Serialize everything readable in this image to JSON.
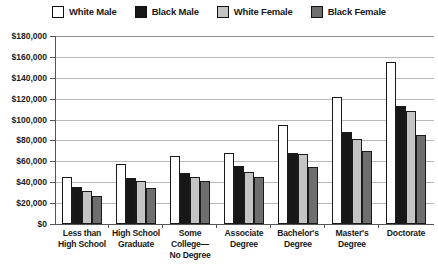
{
  "chart_data": {
    "type": "bar",
    "title": "",
    "xlabel": "",
    "ylabel": "",
    "ylim": [
      0,
      180000
    ],
    "grid": true,
    "legend_position": "top-center",
    "categories": [
      "Less than\nHigh School",
      "High School\nGraduate",
      "Some College—\nNo Degree",
      "Associate\nDegree",
      "Bachelor's\nDegree",
      "Master's\nDegree",
      "Doctorate"
    ],
    "category_lines": [
      [
        "Less than",
        "High School"
      ],
      [
        "High School",
        "Graduate"
      ],
      [
        "Some College—",
        "No Degree"
      ],
      [
        "Associate",
        "Degree"
      ],
      [
        "Bachelor's",
        "Degree"
      ],
      [
        "Master's",
        "Degree"
      ],
      [
        "Doctorate",
        ""
      ]
    ],
    "ytick_labels": [
      "$180,000",
      "$160,000",
      "$140,000",
      "$120,000",
      "$100,000",
      "$80,000",
      "$60,000",
      "$40,000",
      "$20,000",
      "$0"
    ],
    "ytick_values": [
      180000,
      160000,
      140000,
      120000,
      100000,
      80000,
      60000,
      40000,
      20000,
      0
    ],
    "series": [
      {
        "name": "White Male",
        "color": "#ffffff",
        "values": [
          45000,
          57000,
          65000,
          68000,
          95000,
          122000,
          155000
        ]
      },
      {
        "name": "Black Male",
        "color": "#171717",
        "values": [
          35000,
          44000,
          49000,
          56000,
          68000,
          88000,
          113000
        ]
      },
      {
        "name": "White Female",
        "color": "#c4c4c4",
        "values": [
          32000,
          41000,
          45000,
          50000,
          67000,
          81000,
          108000
        ]
      },
      {
        "name": "Black Female",
        "color": "#6e6e6e",
        "values": [
          27000,
          34000,
          41000,
          45000,
          55000,
          70000,
          85000
        ]
      }
    ]
  },
  "legend": {
    "items": [
      {
        "label": "White Male",
        "color": "#ffffff"
      },
      {
        "label": "Black Male",
        "color": "#171717"
      },
      {
        "label": "White Female",
        "color": "#c4c4c4"
      },
      {
        "label": "Black Female",
        "color": "#6e6e6e"
      }
    ]
  }
}
